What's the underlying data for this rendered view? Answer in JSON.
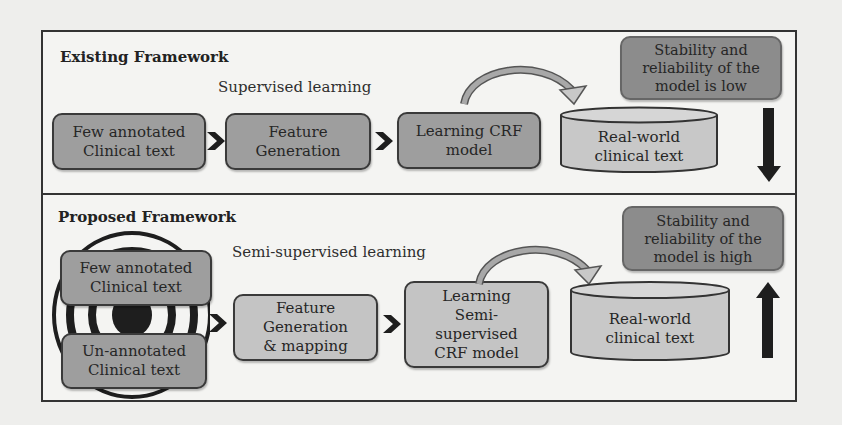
{
  "existing": {
    "title": "Existing Framework",
    "caption": "Supervised learning",
    "steps": [
      "Few annotated\nClinical text",
      "Feature\nGeneration",
      "Learning CRF\nmodel"
    ],
    "dataset": "Real-world\nclinical text",
    "outcome": "Stability and\nreliability of the\nmodel is low",
    "outcome_arrow": "down"
  },
  "proposed": {
    "title": "Proposed Framework",
    "caption": "Semi-supervised learning",
    "inputs": [
      "Few annotated\nClinical text",
      "Un-annotated\nClinical text"
    ],
    "steps": [
      "Feature\nGeneration\n& mapping",
      "Learning\nSemi-\nsupervised\nCRF model"
    ],
    "dataset": "Real-world\nclinical text",
    "outcome": "Stability and\nreliability of the\nmodel is high",
    "outcome_arrow": "up"
  },
  "colors": {
    "box_mid": "#9e9e9e",
    "box_light": "#c4c4c4",
    "box_dark": "#8c8c8c",
    "cylinder": "#c8c8c8",
    "border": "#333333",
    "arrow": "#1e1e1e"
  }
}
